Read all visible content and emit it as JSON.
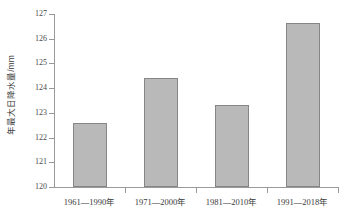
{
  "chart_data": {
    "type": "bar",
    "title": "",
    "xlabel": "",
    "ylabel": "年最大日降水量/mm",
    "ylim": [
      120,
      127
    ],
    "ytick_step": 1,
    "yticks": [
      "127",
      "126",
      "125",
      "124",
      "123",
      "122",
      "121",
      "120"
    ],
    "grid": false,
    "legend": false,
    "categories": [
      "1961—1990年",
      "1971—2000年",
      "1981—2010年",
      "1991—2018年"
    ],
    "values": [
      122.6,
      124.4,
      123.3,
      126.65
    ],
    "bar_fill_color": "#b9b9b9",
    "bar_border_color": "#868686",
    "axis_color": "#9a9a9a",
    "background_color": "#ffffff"
  },
  "caption": ""
}
